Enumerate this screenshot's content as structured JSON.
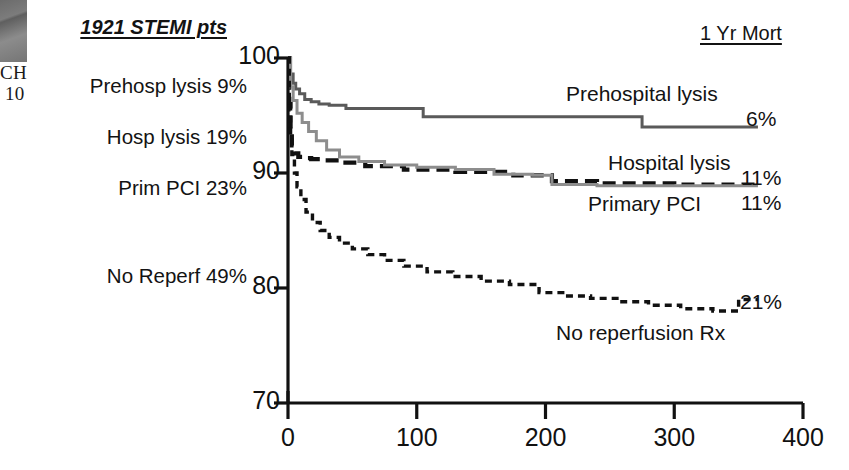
{
  "page_fragment": {
    "corner_text_1": "CH",
    "corner_text_2": "10"
  },
  "left_panel": {
    "title": "1921 STEMI pts",
    "items": [
      {
        "label": "Prehosp lysis 9%"
      },
      {
        "label": "Hosp lysis 19%"
      },
      {
        "label": "Prim PCI 23%"
      },
      {
        "label": "No Reperf 49%"
      }
    ]
  },
  "legend": {
    "mortality_header": "1 Yr Mort"
  },
  "chart_data": {
    "type": "line",
    "title": "1921 STEMI pts",
    "subtitle": "Kaplan-Meier survival by reperfusion strategy",
    "xlabel": "",
    "ylabel": "",
    "xlim": [
      0,
      400
    ],
    "ylim": [
      70,
      100
    ],
    "xticks": [
      "0",
      "100",
      "200",
      "300",
      "400"
    ],
    "xtick_values": [
      0,
      100,
      200,
      300,
      400
    ],
    "yticks": [
      "70",
      "80",
      "90",
      "100"
    ],
    "ytick_values": [
      70,
      80,
      90,
      100
    ],
    "grid": false,
    "legend_position": "inline-right",
    "x_units": "days",
    "y_units": "percent survival",
    "series": [
      {
        "name": "Prehospital lysis",
        "label": "Prehospital lysis",
        "mortality": "6%",
        "cohort_share": "9%",
        "style": "solid",
        "color": "#5a5a5a",
        "x": [
          0,
          2,
          4,
          6,
          9,
          13,
          18,
          24,
          32,
          45,
          105,
          275,
          365
        ],
        "y": [
          100,
          98.6,
          97.8,
          97.3,
          96.9,
          96.4,
          96.2,
          96.0,
          95.9,
          95.6,
          94.9,
          94.0,
          94.0
        ]
      },
      {
        "name": "Hospital lysis",
        "label": "Hospital lysis",
        "mortality": "11%",
        "cohort_share": "19%",
        "style": "dashed",
        "color": "#111111",
        "x": [
          0,
          1,
          2,
          3,
          5,
          8,
          12,
          18,
          26,
          40,
          60,
          90,
          130,
          175,
          205,
          240,
          300,
          365
        ],
        "y": [
          100,
          96.0,
          93.8,
          92.4,
          91.7,
          91.4,
          91.3,
          91.2,
          91.1,
          90.9,
          90.6,
          90.3,
          90.1,
          89.8,
          89.3,
          89.1,
          89.0,
          89.0
        ]
      },
      {
        "name": "Primary PCI",
        "label": "Primary PCI",
        "mortality": "11%",
        "cohort_share": "23%",
        "style": "solid",
        "color": "#8d8d8d",
        "x": [
          0,
          2,
          4,
          7,
          11,
          16,
          22,
          30,
          40,
          55,
          75,
          100,
          130,
          160,
          190,
          205,
          240,
          300,
          365
        ],
        "y": [
          100,
          97.5,
          96.3,
          95.2,
          94.4,
          93.6,
          92.8,
          92.0,
          91.4,
          91.0,
          90.7,
          90.5,
          90.3,
          89.9,
          89.8,
          89.0,
          88.9,
          88.9,
          88.9
        ]
      },
      {
        "name": "No reperfusion Rx",
        "label": "No reperfusion Rx",
        "mortality": "21%",
        "cohort_share": "49%",
        "style": "fine-dashed",
        "color": "#111111",
        "x": [
          0,
          1,
          2,
          3,
          5,
          7,
          10,
          14,
          19,
          25,
          32,
          40,
          50,
          62,
          75,
          90,
          108,
          128,
          150,
          172,
          195,
          215,
          235,
          258,
          280,
          305,
          330,
          350,
          365
        ],
        "y": [
          100,
          95.5,
          93.2,
          91.6,
          90.0,
          88.8,
          87.7,
          86.6,
          85.7,
          85.0,
          84.4,
          83.9,
          83.4,
          82.9,
          82.4,
          81.9,
          81.4,
          81.0,
          80.6,
          80.3,
          79.6,
          79.3,
          79.1,
          78.8,
          78.5,
          78.2,
          78.0,
          79.0,
          79.0
        ]
      }
    ]
  }
}
